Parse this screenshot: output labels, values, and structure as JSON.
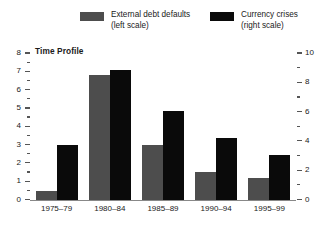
{
  "legend": {
    "items": [
      {
        "name": "external-debt-defaults",
        "label_line1": "External debt defaults",
        "label_line2": "(left scale)",
        "color": "#4d4d4d"
      },
      {
        "name": "currency-crises",
        "label_line1": "Currency crises",
        "label_line2": "(right scale)",
        "color": "#0a0a0a"
      }
    ]
  },
  "chart_data": {
    "type": "bar",
    "title": "Time Profile",
    "xlabel": "",
    "categories": [
      "1975–79",
      "1980–84",
      "1985–89",
      "1990–94",
      "1995–99"
    ],
    "series": [
      {
        "name": "External debt defaults",
        "scale": "left",
        "ylabel": "",
        "color": "#4d4d4d",
        "values": [
          0.5,
          6.8,
          3.0,
          1.55,
          1.2
        ]
      },
      {
        "name": "Currency crises",
        "scale": "right",
        "ylabel": "",
        "color": "#0a0a0a",
        "values": [
          3.75,
          8.9,
          6.1,
          4.2,
          3.1
        ]
      }
    ],
    "left_axis": {
      "ylim": [
        0,
        8
      ],
      "major_ticks": [
        0,
        1,
        2,
        3,
        4,
        5,
        6,
        7,
        8
      ],
      "tick_labels": [
        "0",
        "1",
        "2",
        "3",
        "4",
        "5",
        "6",
        "7",
        "8"
      ],
      "minor_ticks": [
        0.5,
        1.5,
        2.5,
        3.5,
        4.5,
        5.5,
        6.5,
        7.5
      ]
    },
    "right_axis": {
      "ylim": [
        0,
        10
      ],
      "major_ticks": [
        0,
        2,
        4,
        6,
        8,
        10
      ],
      "tick_labels": [
        "0",
        "2",
        "4",
        "6",
        "8",
        "10"
      ],
      "minor_ticks": [
        1,
        3,
        5,
        7,
        9
      ]
    },
    "grid": false,
    "legend_position": "top"
  }
}
